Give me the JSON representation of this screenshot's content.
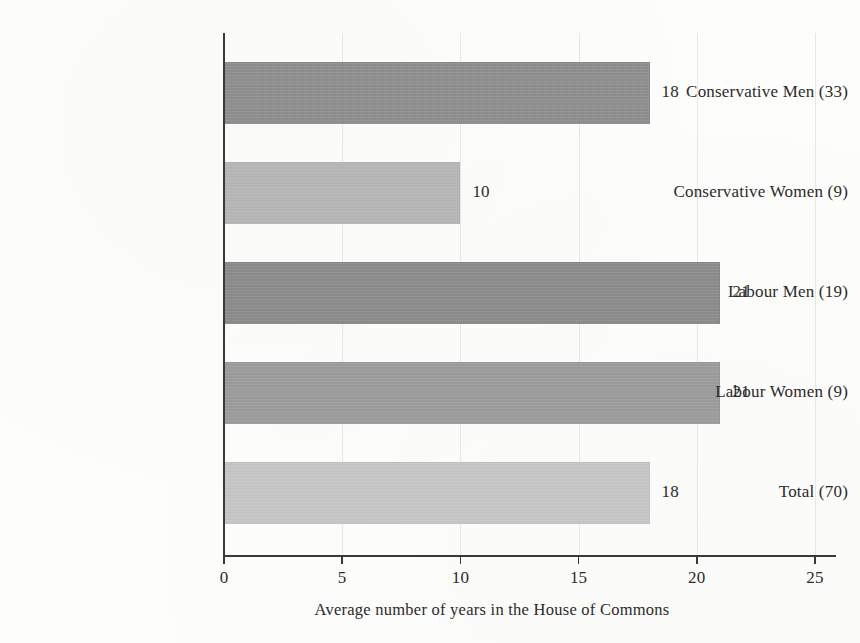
{
  "chart_data": {
    "type": "bar",
    "orientation": "horizontal",
    "title": "",
    "xlabel": "Average number of years in the House of Commons",
    "ylabel": "",
    "xlim": [
      0,
      25
    ],
    "xticks": [
      0,
      5,
      10,
      15,
      20,
      25
    ],
    "xtick_labels": [
      "0",
      "5",
      "10",
      "15",
      "20",
      "25"
    ],
    "grid": true,
    "grid_axis": "x",
    "legend": "none",
    "categories": [
      "Conservative Men (33)",
      "Conservative Women (9)",
      "Labour Men (19)",
      "Labour Women (9)",
      "Total (70)"
    ],
    "values": [
      18,
      10,
      21,
      21,
      18
    ],
    "value_labels": [
      "18",
      "10",
      "21",
      "21",
      "18"
    ],
    "bar_colors": [
      "#8d8d8d",
      "#b6b6b6",
      "#8a8a8a",
      "#9b9b9b",
      "#c6c6c6"
    ],
    "group_counts": [
      33,
      9,
      19,
      9,
      70
    ],
    "bars": [
      {
        "category": "Conservative Men (33)",
        "value": 18,
        "label": "18",
        "color": "#8d8d8d"
      },
      {
        "category": "Conservative Women (9)",
        "value": 10,
        "label": "10",
        "color": "#b6b6b6"
      },
      {
        "category": "Labour Men (19)",
        "value": 21,
        "label": "21",
        "color": "#8a8a8a"
      },
      {
        "category": "Labour Women (9)",
        "value": 21,
        "label": "21",
        "color": "#9b9b9b"
      },
      {
        "category": "Total (70)",
        "value": 18,
        "label": "18",
        "color": "#c6c6c6"
      }
    ]
  },
  "axis": {
    "title": "Average number of years in the House of Commons"
  },
  "colors": {
    "background": "#fdfdfb",
    "axis": "#3a3a3a",
    "grid": "#e7e7e3",
    "text": "#2b2b2b"
  }
}
